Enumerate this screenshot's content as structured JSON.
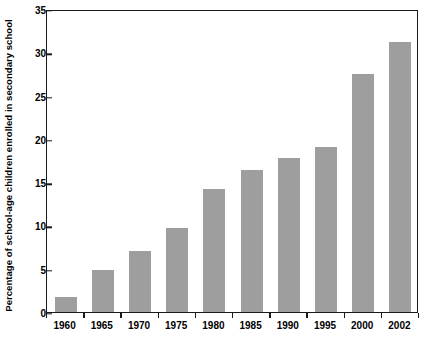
{
  "chart_data": {
    "type": "bar",
    "title": "",
    "subtitle": "",
    "xlabel": "",
    "ylabel": "Percentage of school-age children enrolled in secondary school",
    "categories": [
      "1960",
      "1965",
      "1970",
      "1975",
      "1980",
      "1985",
      "1990",
      "1995",
      "2000",
      "2002"
    ],
    "values": [
      1.7,
      4.9,
      7.0,
      9.7,
      14.2,
      16.4,
      17.8,
      19.1,
      27.5,
      31.2
    ],
    "ylim": [
      0,
      35
    ],
    "yticks": [
      0,
      5,
      10,
      15,
      20,
      25,
      30,
      35
    ],
    "ytick_labels": [
      "0",
      "5",
      "10",
      "15",
      "20",
      "25",
      "30",
      "35"
    ],
    "grid": false,
    "legend": null,
    "legend_position": "none",
    "annotations": [],
    "series": [
      {
        "name": "Percentage enrolled",
        "values": [
          1.7,
          4.9,
          7.0,
          9.7,
          14.2,
          16.4,
          17.8,
          19.1,
          27.5,
          31.2
        ]
      }
    ]
  },
  "style": {
    "bar_color": "#9e9e9e",
    "axis_color": "#1a1a1a",
    "text_color": "#000000",
    "background": "#ffffff"
  }
}
